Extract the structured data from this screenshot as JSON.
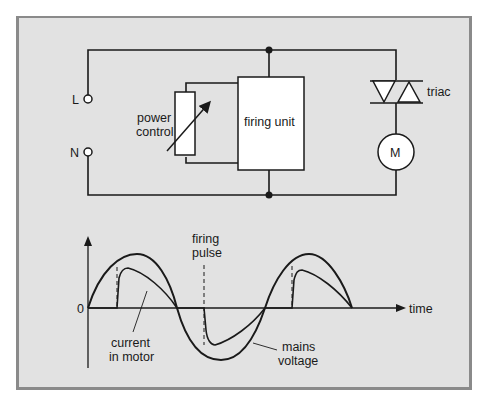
{
  "circuit": {
    "terminals": {
      "live": "L",
      "neutral": "N"
    },
    "power_control_label": [
      "power",
      "control"
    ],
    "firing_unit_label": "firing unit",
    "triac_label": "triac",
    "motor_label": "M"
  },
  "waveform": {
    "origin_label": "0",
    "x_axis_label": "time",
    "firing_pulse_label": [
      "firing",
      "pulse"
    ],
    "current_label": [
      "current",
      "in motor"
    ],
    "voltage_label": [
      "mains",
      "voltage"
    ]
  },
  "colors": {
    "panel_bg": "#e2e2e2",
    "panel_border": "#8a8a8a",
    "line": "#1a1a1a",
    "component_fill": "#ffffff"
  }
}
